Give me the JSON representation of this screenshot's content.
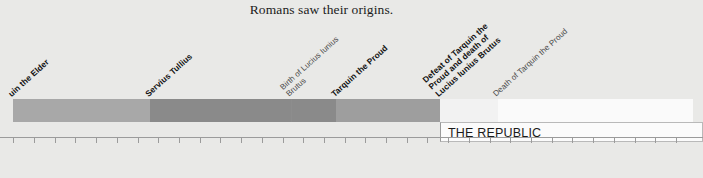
{
  "caption": "Romans saw their origins.",
  "timeline": {
    "axis": {
      "orientation": "horizontal",
      "direction": "bc-descending",
      "start_year": 612,
      "end_year": 448,
      "major_tick_labels": [
        "600",
        "580",
        "560",
        "540",
        "520",
        "500",
        "480",
        "460"
      ],
      "major_tick_years": [
        600,
        580,
        560,
        540,
        520,
        500,
        480,
        460
      ],
      "minor_tick_interval": 5,
      "pixels_per_year": 4.142,
      "origin_px": 63,
      "origin_year": 600
    },
    "segments": [
      {
        "name": "tarquin-the-elder-reign",
        "start_year": 612,
        "end_year": 579,
        "color": "#a8a8a8"
      },
      {
        "name": "servius-tullius-reign",
        "start_year": 579,
        "end_year": 545,
        "color": "#8a8a8a"
      },
      {
        "name": "brutus-birth-interval",
        "start_year": 545,
        "end_year": 534,
        "color": "#8a8a8a"
      },
      {
        "name": "tarquin-the-proud-reign",
        "start_year": 534,
        "end_year": 509,
        "color": "#9e9e9e"
      },
      {
        "name": "transition-509-495",
        "start_year": 509,
        "end_year": 495,
        "color": "#f2f2f2"
      },
      {
        "name": "republic-period",
        "start_year": 495,
        "end_year": 448,
        "color": "#fafafa"
      }
    ],
    "events": [
      {
        "id": "tarquin-the-elder",
        "label": "Tarquin the Elder",
        "display": "uin the Elder",
        "year": 612,
        "style": "bold",
        "clipped": true
      },
      {
        "id": "servius-tullius",
        "label": "Servius Tullius",
        "display": "Servius Tullius",
        "year": 579,
        "style": "bold",
        "clipped": false
      },
      {
        "id": "birth-of-lucius-iunius-brutus",
        "label": "Birth of Lucius Iunius Brutus",
        "display": "Birth of Lucius Iunius\nBrutus",
        "year": 545,
        "style": "light",
        "clipped": false
      },
      {
        "id": "tarquin-the-proud",
        "label": "Tarquin the Proud",
        "display": "Tarquin the Proud",
        "year": 534,
        "style": "bold",
        "clipped": false
      },
      {
        "id": "defeat-of-tarquin-the-proud",
        "label": "Defeat of Tarquin the Proud and death of Lucius Iunius Brutus",
        "display": "Defeat of Tarquin the\nProud and death of\nLucius Iunius Brutus",
        "year": 509,
        "style": "bold",
        "clipped": false
      },
      {
        "id": "death-of-tarquin-the-proud",
        "label": "Death of Tarquin the Proud",
        "display": "Death of Tarquin the Proud",
        "year": 495,
        "style": "light",
        "clipped": false
      }
    ],
    "period_label": {
      "text": "THE REPUBLIC",
      "start_year": 509,
      "end_year": 448
    }
  },
  "colors": {
    "background": "#e9e9e7",
    "axis": "#9b9b9b",
    "text": "#1a1a1a"
  }
}
